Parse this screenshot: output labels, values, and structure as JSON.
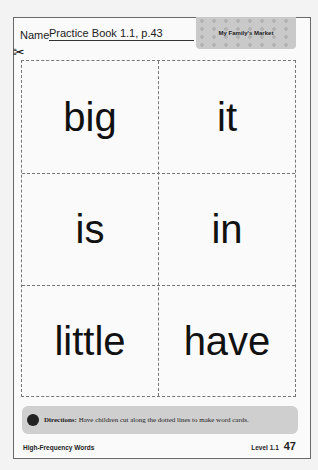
{
  "header": {
    "name_label": "Name",
    "name_value": "Practice Book 1.1, p.43",
    "banner_title": "My Family's Market"
  },
  "icons": {
    "scissors": "✂",
    "apple": "apple-icon"
  },
  "word_cards": [
    {
      "word": "big"
    },
    {
      "word": "it"
    },
    {
      "word": "is"
    },
    {
      "word": "in"
    },
    {
      "word": "little"
    },
    {
      "word": "have"
    }
  ],
  "directions": {
    "label": "Directions:",
    "text": " Have children cut along the dotted lines to make word cards."
  },
  "footer": {
    "left": "High-Frequency Words",
    "level": "Level 1.1",
    "page_number": "47"
  }
}
